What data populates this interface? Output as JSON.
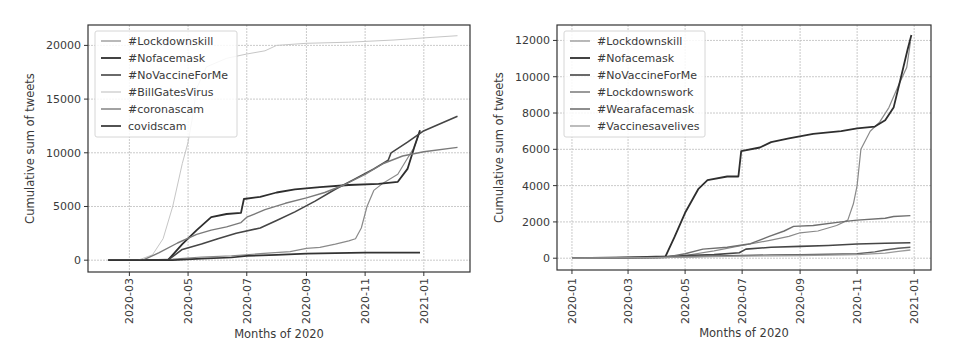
{
  "chart_data": [
    {
      "type": "line",
      "title": "",
      "xlabel": "Months of 2020",
      "ylabel": "Cumulative sum of tweets",
      "ylim": [
        -1100,
        21900
      ],
      "xlim": [
        "2020-01-18",
        "2021-02-18"
      ],
      "grid": true,
      "legend_position": "upper left",
      "x_ticks": [
        "2020-03",
        "2020-05",
        "2020-07",
        "2020-09",
        "2020-11",
        "2021-01"
      ],
      "y_ticks": [
        0,
        5000,
        10000,
        15000,
        20000
      ],
      "y_tick_labels": [
        "0",
        "5000",
        "10000",
        "15000",
        "20000"
      ],
      "series": [
        {
          "name": "#Lockdownskill",
          "color": "#8a8a8a",
          "width": 1.2,
          "points": [
            [
              "2020-02-08",
              0
            ],
            [
              "2020-03-15",
              0
            ],
            [
              "2020-04-15",
              100
            ],
            [
              "2020-05-15",
              300
            ],
            [
              "2020-06-15",
              400
            ],
            [
              "2020-07-15",
              600
            ],
            [
              "2020-08-15",
              800
            ],
            [
              "2020-09-01",
              1100
            ],
            [
              "2020-09-15",
              1200
            ],
            [
              "2020-10-01",
              1500
            ],
            [
              "2020-10-15",
              1800
            ],
            [
              "2020-10-22",
              2000
            ],
            [
              "2020-10-28",
              3000
            ],
            [
              "2020-11-03",
              5000
            ],
            [
              "2020-11-10",
              6500
            ],
            [
              "2020-11-20",
              7200
            ],
            [
              "2020-12-05",
              8000
            ],
            [
              "2020-12-15",
              9500
            ],
            [
              "2020-12-22",
              10500
            ],
            [
              "2020-12-28",
              12000
            ]
          ]
        },
        {
          "name": "#Nofacemask",
          "color": "#2e2e2e",
          "width": 1.8,
          "points": [
            [
              "2020-02-08",
              0
            ],
            [
              "2020-03-25",
              0
            ],
            [
              "2020-04-10",
              0
            ],
            [
              "2020-04-25",
              1500
            ],
            [
              "2020-05-10",
              2800
            ],
            [
              "2020-05-25",
              4000
            ],
            [
              "2020-06-10",
              4300
            ],
            [
              "2020-06-25",
              4400
            ],
            [
              "2020-06-28",
              5700
            ],
            [
              "2020-07-15",
              5900
            ],
            [
              "2020-08-01",
              6300
            ],
            [
              "2020-08-20",
              6600
            ],
            [
              "2020-09-15",
              6800
            ],
            [
              "2020-10-15",
              7000
            ],
            [
              "2020-11-15",
              7100
            ],
            [
              "2020-12-05",
              7300
            ],
            [
              "2020-12-15",
              8500
            ],
            [
              "2020-12-22",
              10500
            ],
            [
              "2020-12-28",
              12100
            ]
          ]
        },
        {
          "name": "#NoVaccineForMe",
          "color": "#454545",
          "width": 1.6,
          "points": [
            [
              "2020-02-08",
              0
            ],
            [
              "2020-03-20",
              0
            ],
            [
              "2020-04-10",
              0
            ],
            [
              "2020-04-25",
              1000
            ],
            [
              "2020-05-15",
              1500
            ],
            [
              "2020-06-01",
              2000
            ],
            [
              "2020-06-20",
              2500
            ],
            [
              "2020-07-15",
              3000
            ],
            [
              "2020-08-01",
              3700
            ],
            [
              "2020-08-20",
              4500
            ],
            [
              "2020-09-10",
              5500
            ],
            [
              "2020-10-01",
              6600
            ],
            [
              "2020-10-20",
              7500
            ],
            [
              "2020-11-10",
              8500
            ],
            [
              "2020-11-25",
              9300
            ],
            [
              "2020-11-28",
              10000
            ],
            [
              "2020-12-15",
              11000
            ],
            [
              "2020-12-31",
              12000
            ],
            [
              "2021-01-15",
              12600
            ],
            [
              "2021-02-05",
              13400
            ]
          ]
        },
        {
          "name": "#BillGatesVirus",
          "color": "#c6c6c6",
          "width": 1.0,
          "points": [
            [
              "2020-02-08",
              0
            ],
            [
              "2020-03-10",
              0
            ],
            [
              "2020-03-25",
              500
            ],
            [
              "2020-04-05",
              2000
            ],
            [
              "2020-04-15",
              5000
            ],
            [
              "2020-04-25",
              9000
            ],
            [
              "2020-05-01",
              11000
            ],
            [
              "2020-05-05",
              13000
            ],
            [
              "2020-05-10",
              16000
            ],
            [
              "2020-05-20",
              18000
            ],
            [
              "2020-06-10",
              18800
            ],
            [
              "2020-07-01",
              19200
            ],
            [
              "2020-07-20",
              19500
            ],
            [
              "2020-08-01",
              20000
            ],
            [
              "2020-09-01",
              20200
            ],
            [
              "2020-10-15",
              20300
            ],
            [
              "2020-12-01",
              20500
            ],
            [
              "2021-01-01",
              20700
            ],
            [
              "2021-02-05",
              20900
            ]
          ]
        },
        {
          "name": "#coronascam",
          "color": "#7a7a7a",
          "width": 1.4,
          "points": [
            [
              "2020-02-08",
              0
            ],
            [
              "2020-03-15",
              0
            ],
            [
              "2020-04-01",
              700
            ],
            [
              "2020-04-20",
              1600
            ],
            [
              "2020-05-10",
              2400
            ],
            [
              "2020-05-25",
              2800
            ],
            [
              "2020-06-10",
              3100
            ],
            [
              "2020-06-25",
              3500
            ],
            [
              "2020-07-01",
              4000
            ],
            [
              "2020-07-20",
              4700
            ],
            [
              "2020-08-10",
              5300
            ],
            [
              "2020-09-01",
              5800
            ],
            [
              "2020-09-20",
              6300
            ],
            [
              "2020-10-10",
              7000
            ],
            [
              "2020-11-01",
              8000
            ],
            [
              "2020-11-20",
              9000
            ],
            [
              "2020-12-10",
              9700
            ],
            [
              "2021-01-01",
              10100
            ],
            [
              "2021-02-05",
              10500
            ]
          ]
        },
        {
          "name": "covidscam",
          "color": "#333333",
          "width": 1.7,
          "points": [
            [
              "2020-02-08",
              0
            ],
            [
              "2020-03-15",
              0
            ],
            [
              "2020-04-15",
              0
            ],
            [
              "2020-05-15",
              150
            ],
            [
              "2020-06-15",
              250
            ],
            [
              "2020-07-01",
              400
            ],
            [
              "2020-08-01",
              500
            ],
            [
              "2020-09-01",
              600
            ],
            [
              "2020-10-01",
              650
            ],
            [
              "2020-11-01",
              700
            ],
            [
              "2020-12-01",
              700
            ],
            [
              "2020-12-28",
              700
            ]
          ]
        }
      ]
    },
    {
      "type": "line",
      "title": "",
      "xlabel": "Months of 2020",
      "ylabel": "Cumulative sum of tweets",
      "ylim": [
        -650,
        12850
      ],
      "xlim": [
        "2019-12-16",
        "2021-01-19"
      ],
      "grid": true,
      "legend_position": "upper left",
      "x_ticks": [
        "2020-01",
        "2020-03",
        "2020-05",
        "2020-07",
        "2020-09",
        "2020-11",
        "2021-01"
      ],
      "y_ticks": [
        0,
        2000,
        4000,
        6000,
        8000,
        10000,
        12000
      ],
      "y_tick_labels": [
        "0",
        "2000",
        "4000",
        "6000",
        "8000",
        "10000",
        "12000"
      ],
      "series": [
        {
          "name": "#Lockdownskill",
          "color": "#8a8a8a",
          "width": 1.2,
          "points": [
            [
              "2020-01-01",
              0
            ],
            [
              "2020-03-15",
              50
            ],
            [
              "2020-05-01",
              150
            ],
            [
              "2020-06-01",
              400
            ],
            [
              "2020-07-01",
              700
            ],
            [
              "2020-08-01",
              1000
            ],
            [
              "2020-08-20",
              1200
            ],
            [
              "2020-09-01",
              1400
            ],
            [
              "2020-09-20",
              1500
            ],
            [
              "2020-10-10",
              1800
            ],
            [
              "2020-10-22",
              2100
            ],
            [
              "2020-10-28",
              3000
            ],
            [
              "2020-11-01",
              4000
            ],
            [
              "2020-11-05",
              6000
            ],
            [
              "2020-11-15",
              7000
            ],
            [
              "2020-11-25",
              7500
            ],
            [
              "2020-12-05",
              8300
            ],
            [
              "2020-12-15",
              9500
            ],
            [
              "2020-12-24",
              10500
            ],
            [
              "2020-12-28",
              11900
            ]
          ]
        },
        {
          "name": "#Nofacemask",
          "color": "#2e2e2e",
          "width": 1.8,
          "points": [
            [
              "2020-01-01",
              0
            ],
            [
              "2020-03-01",
              50
            ],
            [
              "2020-04-10",
              100
            ],
            [
              "2020-04-20",
              1200
            ],
            [
              "2020-05-01",
              2500
            ],
            [
              "2020-05-15",
              3800
            ],
            [
              "2020-05-25",
              4300
            ],
            [
              "2020-06-15",
              4500
            ],
            [
              "2020-06-27",
              4500
            ],
            [
              "2020-06-30",
              5900
            ],
            [
              "2020-07-20",
              6100
            ],
            [
              "2020-08-01",
              6400
            ],
            [
              "2020-08-20",
              6600
            ],
            [
              "2020-09-15",
              6850
            ],
            [
              "2020-10-15",
              7000
            ],
            [
              "2020-11-01",
              7150
            ],
            [
              "2020-11-20",
              7250
            ],
            [
              "2020-12-01",
              7600
            ],
            [
              "2020-12-10",
              8300
            ],
            [
              "2020-12-18",
              10000
            ],
            [
              "2020-12-25",
              11500
            ],
            [
              "2020-12-29",
              12300
            ]
          ]
        },
        {
          "name": "#NoVaccineForMe",
          "color": "#454545",
          "width": 1.6,
          "points": [
            [
              "2020-01-01",
              0
            ],
            [
              "2020-04-01",
              50
            ],
            [
              "2020-05-01",
              150
            ],
            [
              "2020-06-01",
              200
            ],
            [
              "2020-06-28",
              300
            ],
            [
              "2020-07-05",
              500
            ],
            [
              "2020-08-01",
              600
            ],
            [
              "2020-09-01",
              650
            ],
            [
              "2020-10-01",
              700
            ],
            [
              "2020-11-01",
              780
            ],
            [
              "2020-12-01",
              820
            ],
            [
              "2020-12-28",
              850
            ]
          ]
        },
        {
          "name": "#Lockdownswork",
          "color": "#6f6f6f",
          "width": 1.4,
          "points": [
            [
              "2020-01-01",
              0
            ],
            [
              "2020-04-10",
              50
            ],
            [
              "2020-05-01",
              250
            ],
            [
              "2020-05-20",
              500
            ],
            [
              "2020-06-15",
              600
            ],
            [
              "2020-07-10",
              800
            ],
            [
              "2020-07-30",
              1200
            ],
            [
              "2020-08-15",
              1500
            ],
            [
              "2020-08-25",
              1750
            ],
            [
              "2020-09-15",
              1800
            ],
            [
              "2020-10-15",
              2000
            ],
            [
              "2020-11-01",
              2100
            ],
            [
              "2020-12-01",
              2200
            ],
            [
              "2020-12-10",
              2300
            ],
            [
              "2020-12-28",
              2350
            ]
          ]
        },
        {
          "name": "#Wearafacemask",
          "color": "#5e5e5e",
          "width": 1.4,
          "points": [
            [
              "2020-01-01",
              0
            ],
            [
              "2020-04-01",
              30
            ],
            [
              "2020-05-01",
              80
            ],
            [
              "2020-06-01",
              120
            ],
            [
              "2020-07-01",
              150
            ],
            [
              "2020-08-01",
              180
            ],
            [
              "2020-09-01",
              200
            ],
            [
              "2020-10-01",
              220
            ],
            [
              "2020-11-01",
              250
            ],
            [
              "2020-11-20",
              350
            ],
            [
              "2020-12-01",
              450
            ],
            [
              "2020-12-15",
              550
            ],
            [
              "2020-12-28",
              600
            ]
          ]
        },
        {
          "name": "#Vaccinesavelives",
          "color": "#9a9a9a",
          "width": 1.3,
          "points": [
            [
              "2020-01-01",
              0
            ],
            [
              "2020-04-01",
              30
            ],
            [
              "2020-05-01",
              60
            ],
            [
              "2020-06-01",
              90
            ],
            [
              "2020-07-01",
              110
            ],
            [
              "2020-08-01",
              130
            ],
            [
              "2020-09-01",
              150
            ],
            [
              "2020-10-01",
              170
            ],
            [
              "2020-11-01",
              200
            ],
            [
              "2020-12-01",
              280
            ],
            [
              "2020-12-15",
              380
            ],
            [
              "2020-12-28",
              450
            ]
          ]
        }
      ]
    }
  ],
  "layout": [
    {
      "plot": {
        "left": 88,
        "top": 25,
        "right": 470,
        "bottom": 272
      },
      "ylabel_x": 34,
      "xlabel_y": 338,
      "tick_label_y": 278,
      "legend": {
        "left": 95,
        "top": 31,
        "width": 142,
        "height": 106
      }
    },
    {
      "plot": {
        "left": 557,
        "top": 25,
        "right": 931,
        "bottom": 270
      },
      "ylabel_x": 503,
      "xlabel_y": 337,
      "tick_label_y": 278,
      "legend": {
        "left": 564,
        "top": 31,
        "width": 141,
        "height": 106
      }
    }
  ],
  "colors": {
    "axes": "#333333",
    "grid": "#bdbdbd",
    "legend_border": "#d6d6d6",
    "text": "#3a3a3a"
  }
}
